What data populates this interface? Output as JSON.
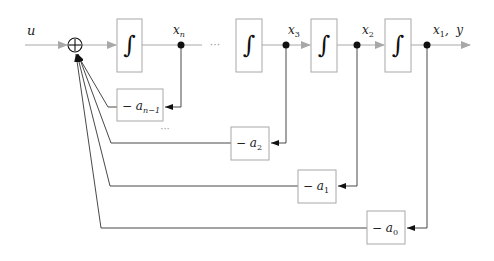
{
  "diagram": {
    "type": "state-space controllable canonical form block diagram",
    "input_label": "u",
    "output_label": "x₁, y",
    "summing_junction": "⊕",
    "integrator_symbol": "∫",
    "ellipsis": "···",
    "state_labels": {
      "xn": {
        "base": "x",
        "sub": "n"
      },
      "x3": {
        "base": "x",
        "sub": "3"
      },
      "x2": {
        "base": "x",
        "sub": "2"
      },
      "x1": {
        "base": "x",
        "sub": "1",
        "suffix": ",  y"
      }
    },
    "gains": [
      {
        "id": "a_n_minus_1",
        "prefix": "− a",
        "sub": "n−1"
      },
      {
        "id": "a2",
        "prefix": "− a",
        "sub": "2"
      },
      {
        "id": "a1",
        "prefix": "− a",
        "sub": "1"
      },
      {
        "id": "a0",
        "prefix": "− a",
        "sub": "0"
      }
    ],
    "colors": {
      "forward_line": "#a8a8a8",
      "feedback_line": "#333333",
      "block_border": "#a8a8a8",
      "node": "#111111"
    }
  }
}
